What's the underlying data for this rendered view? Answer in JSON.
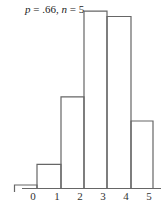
{
  "chart_data": {
    "type": "bar",
    "title": "p = .66, n = 5",
    "title_parts": {
      "p_var": "p",
      "p_val": " = .66, ",
      "n_var": "n",
      "n_val": " = 5"
    },
    "categories": [
      "0",
      "1",
      "2",
      "3",
      "4",
      "5"
    ],
    "values": [
      0.0045,
      0.044,
      0.17,
      0.33,
      0.32,
      0.125
    ],
    "xlabel": "",
    "ylabel": "",
    "ylim": [
      0,
      0.33
    ],
    "grid": false,
    "legend": "none",
    "style": {
      "stroke": "#666666",
      "fill": "none",
      "bar_width_px": 23,
      "baseline_y": 188,
      "px_per_unit": 536
    }
  }
}
